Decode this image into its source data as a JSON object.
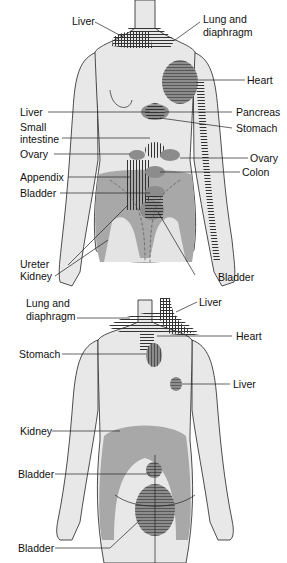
{
  "diagram": {
    "views": {
      "front": {
        "labels": {
          "liver_top": "Liver",
          "lung_diaphragm": "Lung and\ndiaphragm",
          "lung_line1": "Lung and",
          "lung_line2": "diaphragm",
          "heart": "Heart",
          "liver_left": "Liver",
          "pancreas": "Pancreas",
          "small_intestine_1": "Small",
          "small_intestine_2": "intestine",
          "stomach": "Stomach",
          "ovary_left": "Ovary",
          "ovary_right": "Ovary",
          "appendix": "Appendix",
          "colon": "Colon",
          "bladder_left": "Bladder",
          "ureter": "Ureter",
          "kidney": "Kidney",
          "bladder_bottom": "Bladder"
        }
      },
      "back": {
        "labels": {
          "lung_line1": "Lung and",
          "lung_line2": "diaphragm",
          "liver_top": "Liver",
          "heart": "Heart",
          "stomach": "Stomach",
          "liver_mid": "Liver",
          "kidney": "Kidney",
          "bladder_upper": "Bladder",
          "bladder_lower": "Bladder"
        }
      }
    },
    "colors": {
      "skin": "#e8e8e8",
      "shade_dark": "#8c8c8c",
      "shade_mid": "#a8a8a8",
      "outline": "#222222",
      "hatch": "#333333"
    }
  }
}
